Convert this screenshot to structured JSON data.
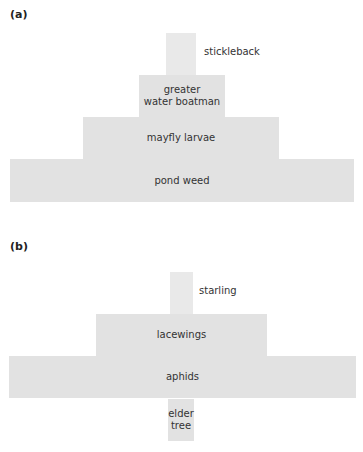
{
  "diagram_a": {
    "label": "(a)",
    "levels": [
      {
        "name": "stickleback",
        "label": "stickleback",
        "label_position": "right"
      },
      {
        "name": "greater water boatman",
        "label_line1": "greater",
        "label_line2": "water boatman"
      },
      {
        "name": "mayfly larvae",
        "label": "mayfly larvae"
      },
      {
        "name": "pond weed",
        "label": "pond weed"
      }
    ]
  },
  "diagram_b": {
    "label": "(b)",
    "levels": [
      {
        "name": "starling",
        "label": "starling",
        "label_position": "right"
      },
      {
        "name": "lacewings",
        "label": "lacewings"
      },
      {
        "name": "aphids",
        "label": "aphids"
      },
      {
        "name": "elder tree",
        "label_line1": "elder",
        "label_line2": "tree"
      }
    ]
  },
  "colors": {
    "box_fill": "#e2e2e2",
    "box_fill_narrow": "#e9e9e9",
    "text": "#333333"
  }
}
